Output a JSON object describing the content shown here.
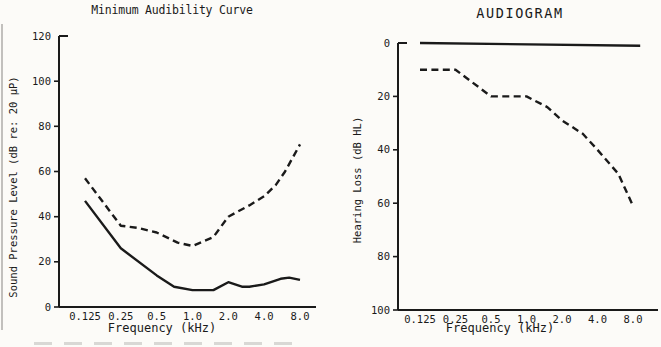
{
  "figure": {
    "paper_color": "#fcfbf8",
    "ink_color": "#1a1a1a"
  },
  "chart_data": [
    {
      "id": "minimum-audibility-curve",
      "type": "line",
      "title": "Minimum Audibility Curve",
      "xlabel": "Frequency (kHz)",
      "ylabel": "Sound Pressure Level (dB re: 20 µP)",
      "x_scale": "log2",
      "x_ticks": [
        0.125,
        0.25,
        0.5,
        1.0,
        2.0,
        4.0,
        8.0
      ],
      "x_tick_labels": [
        "0.125",
        "0.25",
        "0.5",
        "1.0",
        "2.0",
        "4.0",
        "8.0"
      ],
      "y_ticks": [
        0,
        20,
        40,
        60,
        80,
        100,
        120
      ],
      "y_tick_labels": [
        "0",
        "20",
        "40",
        "60",
        "80",
        "100",
        "120"
      ],
      "ylim": [
        0,
        120
      ],
      "y_inverted": false,
      "grid": false,
      "legend": "none",
      "series": [
        {
          "name": "normal-hearing-threshold",
          "style": "solid",
          "x": [
            0.125,
            0.25,
            0.5,
            0.7,
            1.0,
            1.5,
            2.0,
            2.6,
            3.0,
            4.0,
            5.5,
            6.5,
            8.0
          ],
          "y": [
            47,
            26,
            14,
            9,
            7.5,
            7.5,
            11,
            9,
            9,
            10,
            12.5,
            13,
            12
          ]
        },
        {
          "name": "impaired-hearing-threshold",
          "style": "dashed",
          "x": [
            0.125,
            0.25,
            0.35,
            0.5,
            0.75,
            1.0,
            1.5,
            2.0,
            3.0,
            4.0,
            5.0,
            6.0,
            8.0
          ],
          "y": [
            57,
            36,
            35,
            33,
            28.5,
            27,
            31,
            40,
            45,
            49,
            54,
            60,
            72
          ]
        }
      ]
    },
    {
      "id": "audiogram",
      "type": "line",
      "title": "AUDIOGRAM",
      "xlabel": "Frequency (kHz)",
      "ylabel": "Hearing Loss (dB HL)",
      "x_scale": "log2",
      "x_ticks": [
        0.125,
        0.25,
        0.5,
        1.0,
        2.0,
        4.0,
        8.0
      ],
      "x_tick_labels": [
        "0.125",
        "0.25",
        "0.5",
        "1.0",
        "2.0",
        "4.0",
        "8.0"
      ],
      "y_ticks": [
        0,
        20,
        40,
        60,
        80,
        100
      ],
      "y_tick_labels": [
        "0",
        "20",
        "40",
        "60",
        "80",
        "100"
      ],
      "ylim": [
        0,
        100
      ],
      "y_inverted": true,
      "grid": false,
      "legend": "none",
      "series": [
        {
          "name": "normal-reference-level",
          "style": "solid",
          "x": [
            0.125,
            9.2
          ],
          "y": [
            0,
            1
          ]
        },
        {
          "name": "patient-hearing-loss",
          "style": "dashed",
          "x": [
            0.125,
            0.25,
            0.5,
            1.0,
            1.5,
            2.0,
            3.0,
            4.0,
            6.0,
            8.0
          ],
          "y": [
            10,
            10,
            20,
            20,
            24,
            29,
            34,
            40,
            49,
            61
          ]
        }
      ]
    }
  ]
}
